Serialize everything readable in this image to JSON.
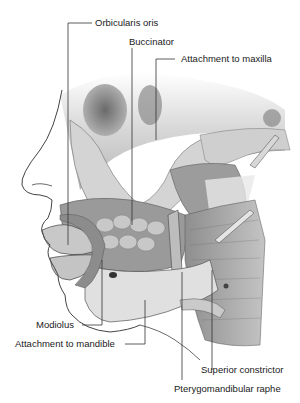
{
  "figure": {
    "labels": {
      "orbicularis_oris": "Orbicularis oris",
      "buccinator": "Buccinator",
      "attachment_maxilla": "Attachment to maxilla",
      "modiolus": "Modiolus",
      "attachment_mandible": "Attachment to mandible",
      "superior_constrictor": "Superior constrictor",
      "pterygomandibular_raphe": "Pterygomandibular raphe"
    }
  },
  "colors": {
    "background": "#ffffff",
    "leader_line": "#333333",
    "bone": "#d8d8d8",
    "muscle": "#9a9a9a",
    "shadow": "#555555"
  }
}
